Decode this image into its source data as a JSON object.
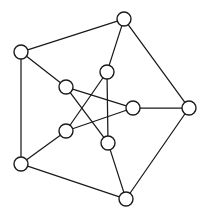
{
  "figure": {
    "background_color": "#ffffff",
    "stroke_color": "#1a1a1a",
    "node_fill_color": "#ffffff",
    "width": 209,
    "height": 220
  },
  "chart_data": {
    "type": "diagram",
    "diagram_type": "undirected-graph",
    "title": "",
    "node_count": 10,
    "edge_count": 15,
    "node_radius": 7,
    "nodes": [
      {
        "id": "outer-top",
        "label": "",
        "x": 124,
        "y": 19,
        "group": "outer"
      },
      {
        "id": "outer-left-upper",
        "label": "",
        "x": 21,
        "y": 52,
        "group": "outer"
      },
      {
        "id": "outer-right",
        "label": "",
        "x": 189,
        "y": 108,
        "group": "outer"
      },
      {
        "id": "outer-left-lower",
        "label": "",
        "x": 21,
        "y": 164,
        "group": "outer"
      },
      {
        "id": "outer-bottom",
        "label": "",
        "x": 126,
        "y": 199,
        "group": "outer"
      },
      {
        "id": "inner-top",
        "label": "",
        "x": 107,
        "y": 72,
        "group": "inner"
      },
      {
        "id": "inner-upper-left",
        "label": "",
        "x": 66,
        "y": 87,
        "group": "inner"
      },
      {
        "id": "inner-right",
        "label": "",
        "x": 133,
        "y": 108,
        "group": "inner"
      },
      {
        "id": "inner-lower-left",
        "label": "",
        "x": 66,
        "y": 131,
        "group": "inner"
      },
      {
        "id": "inner-bottom",
        "label": "",
        "x": 108,
        "y": 143,
        "group": "inner"
      }
    ],
    "edges": [
      {
        "source": "outer-left-upper",
        "target": "outer-top",
        "kind": "outer-cycle"
      },
      {
        "source": "outer-top",
        "target": "outer-right",
        "kind": "outer-cycle"
      },
      {
        "source": "outer-right",
        "target": "outer-bottom",
        "kind": "outer-cycle"
      },
      {
        "source": "outer-bottom",
        "target": "outer-left-lower",
        "kind": "outer-cycle"
      },
      {
        "source": "outer-left-lower",
        "target": "outer-left-upper",
        "kind": "outer-cycle"
      },
      {
        "source": "outer-top",
        "target": "inner-top",
        "kind": "spoke"
      },
      {
        "source": "outer-left-upper",
        "target": "inner-upper-left",
        "kind": "spoke"
      },
      {
        "source": "outer-right",
        "target": "inner-right",
        "kind": "spoke"
      },
      {
        "source": "outer-left-lower",
        "target": "inner-lower-left",
        "kind": "spoke"
      },
      {
        "source": "outer-bottom",
        "target": "inner-bottom",
        "kind": "spoke"
      },
      {
        "source": "inner-top",
        "target": "inner-lower-left",
        "kind": "pentagram"
      },
      {
        "source": "inner-top",
        "target": "inner-bottom",
        "kind": "pentagram"
      },
      {
        "source": "inner-upper-left",
        "target": "inner-right",
        "kind": "pentagram"
      },
      {
        "source": "inner-upper-left",
        "target": "inner-bottom",
        "kind": "pentagram"
      },
      {
        "source": "inner-right",
        "target": "inner-lower-left",
        "kind": "pentagram"
      }
    ],
    "legend": [],
    "annotations": []
  }
}
